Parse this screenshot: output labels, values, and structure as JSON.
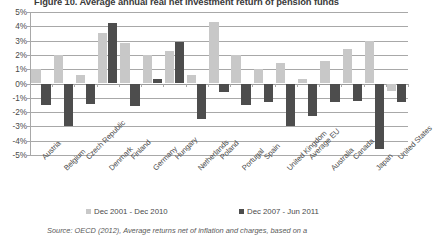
{
  "chart_data": {
    "type": "bar",
    "title": "Figure 10. Average annual real net investment return of pension funds",
    "xlabel": "",
    "ylabel": "",
    "ylim": [
      -5,
      5
    ],
    "ytick_labels": [
      "5%",
      "4%",
      "3%",
      "2%",
      "1%",
      "0%",
      "-1%",
      "-2%",
      "-3%",
      "-4%",
      "-5%"
    ],
    "ytick_values": [
      5,
      4,
      3,
      2,
      1,
      0,
      -1,
      -2,
      -3,
      -4,
      -5
    ],
    "grid": true,
    "legend_position": "bottom",
    "categories": [
      "Austria",
      "Belgium",
      "Czech Republic",
      "Denmark",
      "Finland",
      "Germany",
      "Hungary",
      "Netherlands",
      "Poland",
      "Portugal",
      "Spain",
      "United Kingdom",
      "Average EU",
      "Australia",
      "Canada",
      "Japan",
      "United States"
    ],
    "series": [
      {
        "name": "Dec 2001 - Dec 2010",
        "color": "#c8c8c8",
        "values": [
          1.0,
          2.0,
          0.6,
          3.5,
          2.8,
          2.0,
          2.3,
          0.6,
          4.3,
          2.0,
          1.0,
          1.4,
          0.3,
          1.6,
          2.4,
          3.0,
          -0.5
        ]
      },
      {
        "name": "Dec 2007 - Jun 2011",
        "color": "#4d4d4d",
        "values": [
          -1.5,
          -3.0,
          -1.4,
          4.2,
          -1.6,
          0.3,
          2.9,
          -2.5,
          -0.6,
          -1.5,
          -1.3,
          -3.0,
          -2.3,
          -1.3,
          -1.2,
          -4.6,
          -1.3
        ]
      }
    ],
    "source": "Source: OECD (2012), Average returns net of inflation and charges, based on a"
  }
}
